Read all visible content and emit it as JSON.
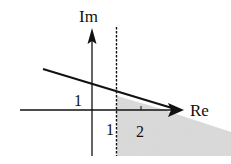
{
  "diagram": {
    "axes": {
      "x_label": "Re",
      "y_label": "Im"
    },
    "tick_labels": {
      "im_one": "1",
      "re_one": "1",
      "re_two": "2"
    },
    "colors": {
      "stroke": "#111111",
      "shade": "#d4d4d4"
    },
    "elements": {
      "dashed_line": "Re = 1 vertical boundary",
      "ray": "line from upper left crossing Im axis at 1 and Re axis at 2.5",
      "shaded_region": "region right of Re = 1, below the ray"
    }
  }
}
